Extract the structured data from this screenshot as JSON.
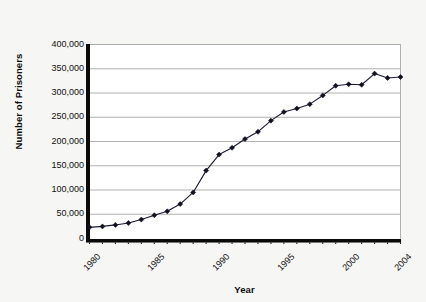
{
  "chart_data": {
    "type": "line",
    "title": "",
    "xlabel": "Year",
    "ylabel": "Number of Prisoners",
    "xlim": [
      1980,
      2004
    ],
    "ylim": [
      0,
      400000
    ],
    "grid": true,
    "legend": false,
    "marker": "diamond",
    "line_color": "#1a1a33",
    "marker_color": "#111122",
    "x": [
      1980,
      1981,
      1982,
      1983,
      1984,
      1985,
      1986,
      1987,
      1988,
      1989,
      1990,
      1991,
      1992,
      1993,
      1994,
      1995,
      1996,
      1997,
      1998,
      1999,
      2000,
      2001,
      2002,
      2003,
      2004
    ],
    "values": [
      23000,
      25000,
      28000,
      32000,
      39000,
      48000,
      56000,
      71000,
      95000,
      140000,
      173000,
      187000,
      205000,
      220000,
      243000,
      261000,
      268000,
      277000,
      295000,
      315000,
      318000,
      317000,
      340000,
      331000,
      333000
    ],
    "series": [
      {
        "name": "Number of Prisoners",
        "values": [
          23000,
          25000,
          28000,
          32000,
          39000,
          48000,
          56000,
          71000,
          95000,
          140000,
          173000,
          187000,
          205000,
          220000,
          243000,
          261000,
          268000,
          277000,
          295000,
          315000,
          318000,
          317000,
          340000,
          331000,
          333000
        ]
      }
    ],
    "yticks": [
      0,
      50000,
      100000,
      150000,
      200000,
      250000,
      300000,
      350000,
      400000
    ],
    "ytick_labels": [
      "0",
      "50,000",
      "100,000",
      "150,000",
      "200,000",
      "250,000",
      "300,000",
      "350,000",
      "400,000"
    ],
    "xticks": [
      1980,
      1985,
      1990,
      1995,
      2000,
      2004
    ],
    "xtick_labels": [
      "1980",
      "1985",
      "1990",
      "1995",
      "2000",
      "2004"
    ]
  },
  "axes": {
    "y_title": "Number of Prisoners",
    "x_title": "Year"
  },
  "colors": {
    "background": "#f6f6f4",
    "plot_background": "#ffffff",
    "gridline": "#a8a8a8",
    "axis_spine": "#0a0a0a",
    "axis_shadow": "#6e6e6e",
    "line": "#1a1a33",
    "marker": "#111122",
    "text": "#111111"
  }
}
